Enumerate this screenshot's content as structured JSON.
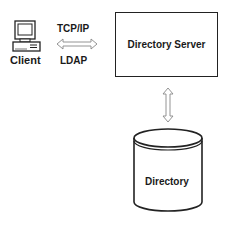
{
  "client": {
    "label": "Client",
    "icon": "desktop-computer-icon"
  },
  "protocols": {
    "top_label": "TCP/IP",
    "bottom_label": "LDAP",
    "arrow": "double-headed-horizontal-arrow"
  },
  "server": {
    "label": "Directory Server"
  },
  "connector": {
    "arrow": "double-headed-vertical-arrow"
  },
  "database": {
    "label": "Directory",
    "icon": "cylinder-database-icon"
  },
  "colors": {
    "stroke": "#222222",
    "arrow_stroke": "#888888",
    "background": "#ffffff"
  }
}
